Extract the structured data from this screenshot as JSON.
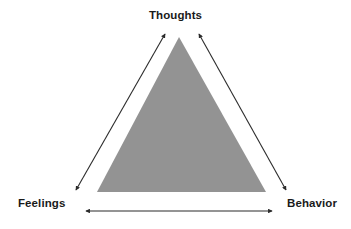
{
  "diagram": {
    "type": "cognitive-triangle",
    "background_color": "#ffffff",
    "shape": {
      "name": "triangle",
      "fill_color": "#939393",
      "apex": {
        "x": 179,
        "y": 37
      },
      "base_left": {
        "x": 97,
        "y": 192
      },
      "base_right": {
        "x": 266,
        "y": 192
      }
    },
    "nodes": [
      {
        "id": "thoughts",
        "label": "Thoughts",
        "position": "top"
      },
      {
        "id": "feelings",
        "label": "Feelings",
        "position": "bottom-left"
      },
      {
        "id": "behavior",
        "label": "Behavior",
        "position": "bottom-right"
      }
    ],
    "connectors": [
      {
        "id": "feelings-thoughts",
        "from": "feelings",
        "to": "thoughts",
        "style": "double-headed-arrow",
        "color": "#2b2b2b",
        "x1": 76,
        "y1": 190,
        "x2": 165,
        "y2": 34
      },
      {
        "id": "thoughts-behavior",
        "from": "thoughts",
        "to": "behavior",
        "style": "double-headed-arrow",
        "color": "#2b2b2b",
        "x1": 199,
        "y1": 34,
        "x2": 286,
        "y2": 190
      },
      {
        "id": "feelings-behavior",
        "from": "feelings",
        "to": "behavior",
        "style": "double-headed-arrow",
        "color": "#2b2b2b",
        "x1": 86,
        "y1": 211,
        "x2": 272,
        "y2": 211
      }
    ]
  }
}
